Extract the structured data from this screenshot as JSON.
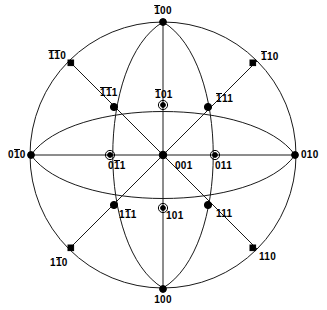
{
  "figure": {
    "type": "stereographic-projection",
    "geometry": {
      "center_x": 163,
      "center_y": 155,
      "radius": 133
    },
    "colors": {
      "line": "#1a1a1a",
      "marker": "#000000",
      "background": "#ffffff",
      "text": "#000000"
    }
  },
  "poles": [
    {
      "id": "pole-bar100-top",
      "label_parts": [
        {
          "t": "1",
          "bar": true
        },
        {
          "t": "00",
          "bar": false
        }
      ],
      "plain": "-100",
      "x": 163,
      "y": 22,
      "marker": "dot",
      "label_x": 163,
      "label_y": 11,
      "align": "center"
    },
    {
      "id": "pole-bar1bar10",
      "label_parts": [
        {
          "t": "1",
          "bar": true
        },
        {
          "t": "1",
          "bar": true
        },
        {
          "t": "0",
          "bar": false
        }
      ],
      "plain": "-1-10",
      "x": 71,
      "y": 63,
      "marker": "square-dot",
      "label_x": 46,
      "label_y": 56,
      "align": "right"
    },
    {
      "id": "pole-bar110",
      "label_parts": [
        {
          "t": "1",
          "bar": true
        },
        {
          "t": "10",
          "bar": false
        }
      ],
      "plain": "-110",
      "x": 253,
      "y": 63,
      "marker": "square-dot",
      "label_x": 261,
      "label_y": 57,
      "align": "left"
    },
    {
      "id": "pole-bar1bar11",
      "label_parts": [
        {
          "t": "1",
          "bar": true
        },
        {
          "t": "1",
          "bar": true
        },
        {
          "t": "1",
          "bar": false
        }
      ],
      "plain": "-1-11",
      "x": 114,
      "y": 107,
      "marker": "star-dot",
      "label_x": 100,
      "label_y": 93,
      "align": "left"
    },
    {
      "id": "pole-bar101",
      "label_parts": [
        {
          "t": "1",
          "bar": true
        },
        {
          "t": "01",
          "bar": false
        }
      ],
      "plain": "-101",
      "x": 163,
      "y": 105,
      "marker": "ring-dot",
      "label_x": 164,
      "label_y": 95,
      "align": "left"
    },
    {
      "id": "pole-bar111",
      "label_parts": [
        {
          "t": "1",
          "bar": true
        },
        {
          "t": "11",
          "bar": false
        }
      ],
      "plain": "-111",
      "x": 208,
      "y": 107,
      "marker": "star-dot",
      "label_x": 216,
      "label_y": 98,
      "align": "left"
    },
    {
      "id": "pole-0bar10",
      "label_parts": [
        {
          "t": "0",
          "bar": false
        },
        {
          "t": "1",
          "bar": true
        },
        {
          "t": "0",
          "bar": false
        }
      ],
      "plain": "0-10",
      "x": 31,
      "y": 155,
      "marker": "dot",
      "label_x": 8,
      "label_y": 155,
      "align": "left"
    },
    {
      "id": "pole-0bar11",
      "label_parts": [
        {
          "t": "0",
          "bar": false
        },
        {
          "t": "1",
          "bar": true
        },
        {
          "t": "1",
          "bar": false
        }
      ],
      "plain": "0-11",
      "x": 110,
      "y": 155,
      "marker": "ring-dot",
      "label_x": 114,
      "label_y": 165,
      "align": "left"
    },
    {
      "id": "pole-001-center",
      "label_parts": [
        {
          "t": "001",
          "bar": false
        }
      ],
      "plain": "001",
      "x": 163,
      "y": 155,
      "marker": "star-dot",
      "label_x": 175,
      "label_y": 165,
      "align": "left"
    },
    {
      "id": "pole-011",
      "label_parts": [
        {
          "t": "011",
          "bar": false
        }
      ],
      "plain": "011",
      "x": 215,
      "y": 155,
      "marker": "ring-dot",
      "label_x": 219,
      "label_y": 165,
      "align": "left"
    },
    {
      "id": "pole-010",
      "label_parts": [
        {
          "t": "010",
          "bar": false
        }
      ],
      "plain": "010",
      "x": 295,
      "y": 155,
      "marker": "dot",
      "label_x": 300,
      "label_y": 155,
      "align": "left"
    },
    {
      "id": "pole-1bar11",
      "label_parts": [
        {
          "t": "1",
          "bar": false
        },
        {
          "t": "1",
          "bar": true
        },
        {
          "t": "1",
          "bar": false
        }
      ],
      "plain": "1-11",
      "x": 114,
      "y": 205,
      "marker": "star-dot",
      "label_x": 120,
      "label_y": 214,
      "align": "left"
    },
    {
      "id": "pole-101",
      "label_parts": [
        {
          "t": "101",
          "bar": false
        }
      ],
      "plain": "101",
      "x": 163,
      "y": 208,
      "marker": "ring-dot",
      "label_x": 167,
      "label_y": 216,
      "align": "left"
    },
    {
      "id": "pole-111",
      "label_parts": [
        {
          "t": "111",
          "bar": false
        }
      ],
      "plain": "111",
      "x": 208,
      "y": 205,
      "marker": "star-dot",
      "label_x": 216,
      "label_y": 214,
      "align": "left"
    },
    {
      "id": "pole-1bar10",
      "label_parts": [
        {
          "t": "1",
          "bar": false
        },
        {
          "t": "1",
          "bar": true
        },
        {
          "t": "0",
          "bar": false
        }
      ],
      "plain": "1-10",
      "x": 71,
      "y": 248,
      "marker": "square-dot",
      "label_x": 50,
      "label_y": 262,
      "align": "left"
    },
    {
      "id": "pole-110",
      "label_parts": [
        {
          "t": "110",
          "bar": false
        }
      ],
      "plain": "110",
      "x": 253,
      "y": 248,
      "marker": "square-dot",
      "label_x": 259,
      "label_y": 257,
      "align": "left"
    },
    {
      "id": "pole-100-bottom",
      "label_parts": [
        {
          "t": "100",
          "bar": false
        }
      ],
      "plain": "100",
      "x": 163,
      "y": 289,
      "marker": "dot",
      "label_x": 163,
      "label_y": 300,
      "align": "center"
    }
  ],
  "chart_data": {
    "type": "scatter",
    "xlabel": "",
    "ylabel": "",
    "grid": false,
    "legend": null,
    "primitive_circle_radius": 133,
    "points": [
      {
        "label": "-100",
        "x": 163,
        "y": 22
      },
      {
        "label": "-1-10",
        "x": 71,
        "y": 63
      },
      {
        "label": "-110",
        "x": 253,
        "y": 63
      },
      {
        "label": "-1-11",
        "x": 114,
        "y": 107
      },
      {
        "label": "-101",
        "x": 163,
        "y": 105
      },
      {
        "label": "-111",
        "x": 208,
        "y": 107
      },
      {
        "label": "0-10",
        "x": 31,
        "y": 155
      },
      {
        "label": "0-11",
        "x": 110,
        "y": 155
      },
      {
        "label": "001",
        "x": 163,
        "y": 155
      },
      {
        "label": "011",
        "x": 215,
        "y": 155
      },
      {
        "label": "010",
        "x": 295,
        "y": 155
      },
      {
        "label": "1-11",
        "x": 114,
        "y": 205
      },
      {
        "label": "101",
        "x": 163,
        "y": 208
      },
      {
        "label": "111",
        "x": 208,
        "y": 205
      },
      {
        "label": "1-10",
        "x": 71,
        "y": 248
      },
      {
        "label": "110",
        "x": 253,
        "y": 248
      },
      {
        "label": "100",
        "x": 163,
        "y": 289
      }
    ]
  }
}
